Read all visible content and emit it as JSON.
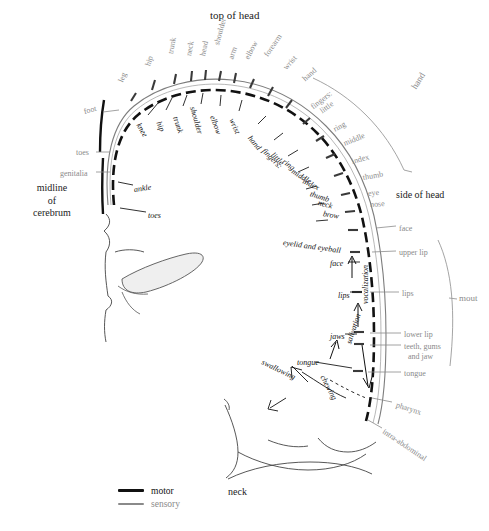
{
  "figure": {
    "type": "anatomical-diagram",
    "name": "penfield-motor-sensory-homunculus",
    "title_top": "top of head",
    "label_side_of_head": "side of head",
    "label_midline": "midline\nof\ncerebrum",
    "label_midline_line1": "midline",
    "label_midline_line2": "of",
    "label_midline_line3": "cerebrum",
    "label_neck_bottom": "neck",
    "bracket_hand": "hand",
    "bracket_mouth": "mout",
    "colors": {
      "motor": "#141414",
      "sensory": "#8a8a8a",
      "background": "#ffffff",
      "outline": "#333333"
    }
  },
  "legend": {
    "items": [
      {
        "label": "motor",
        "style": "thick-black-line",
        "color": "#141414"
      },
      {
        "label": "sensory",
        "style": "thin-gray-line",
        "color": "#8a8a8a"
      }
    ]
  },
  "sensory_strip": {
    "description": "Outer gray labels — postcentral (sensory) homunculus",
    "labels": [
      {
        "text": "leg",
        "rot": -68,
        "x": 121,
        "y": 78
      },
      {
        "text": "hip",
        "rot": -72,
        "x": 148,
        "y": 62
      },
      {
        "text": "trunk",
        "rot": -80,
        "x": 171,
        "y": 50
      },
      {
        "text": "neck",
        "rot": -80,
        "x": 189,
        "y": 52
      },
      {
        "text": "head",
        "rot": -78,
        "x": 203,
        "y": 52
      },
      {
        "text": "shoulder",
        "rot": -75,
        "x": 217,
        "y": 41
      },
      {
        "text": "arm",
        "rot": -70,
        "x": 231,
        "y": 55
      },
      {
        "text": "elbow",
        "rot": -62,
        "x": 247,
        "y": 55
      },
      {
        "text": "forearm",
        "rot": -55,
        "x": 266,
        "y": 52
      },
      {
        "text": "wrist",
        "rot": -48,
        "x": 285,
        "y": 65
      },
      {
        "text": "hand",
        "rot": -42,
        "x": 304,
        "y": 76
      },
      {
        "text": "fingers:",
        "rot": -38,
        "x": 312,
        "y": 104
      },
      {
        "text": "little",
        "rot": -36,
        "x": 321,
        "y": 108
      },
      {
        "text": "ring",
        "rot": -28,
        "x": 334,
        "y": 126
      },
      {
        "text": "middle",
        "rot": -22,
        "x": 344,
        "y": 140
      },
      {
        "text": "index",
        "rot": -16,
        "x": 352,
        "y": 158
      },
      {
        "text": "thumb",
        "rot": -10,
        "x": 363,
        "y": 174
      },
      {
        "text": "eye",
        "rot": -6,
        "x": 368,
        "y": 190
      },
      {
        "text": "nose",
        "rot": -4,
        "x": 370,
        "y": 201
      },
      {
        "text": "face",
        "rot": 0,
        "x": 399,
        "y": 225
      },
      {
        "text": "upper lip",
        "rot": 0,
        "x": 399,
        "y": 249
      },
      {
        "text": "lips",
        "rot": 0,
        "x": 402,
        "y": 290
      },
      {
        "text": "lower lip",
        "rot": 0,
        "x": 404,
        "y": 331
      },
      {
        "text": "teeth, gums",
        "rot": 0,
        "x": 404,
        "y": 343
      },
      {
        "text": "and jaw",
        "rot": 0,
        "x": 408,
        "y": 353
      },
      {
        "text": "tongue",
        "rot": 0,
        "x": 404,
        "y": 370
      },
      {
        "text": "pharynx",
        "rot": 18,
        "x": 396,
        "y": 401
      },
      {
        "text": "intra-abdominal",
        "rot": 34,
        "x": 383,
        "y": 427
      },
      {
        "text": "foot",
        "rot": -14,
        "x": 84,
        "y": 108
      },
      {
        "text": "toes",
        "rot": 0,
        "x": 76,
        "y": 149
      },
      {
        "text": "genitalia",
        "rot": 0,
        "x": 60,
        "y": 170
      }
    ]
  },
  "motor_strip": {
    "description": "Inner black italic labels — precentral (motor) homunculus",
    "labels": [
      {
        "text": "knee",
        "rot": 60,
        "x": 138,
        "y": 120
      },
      {
        "text": "hip",
        "rot": 66,
        "x": 158,
        "y": 118
      },
      {
        "text": "trunk",
        "rot": 72,
        "x": 175,
        "y": 113
      },
      {
        "text": "shoulder",
        "rot": 74,
        "x": 192,
        "y": 103
      },
      {
        "text": "elbow",
        "rot": 70,
        "x": 212,
        "y": 112
      },
      {
        "text": "wrist",
        "rot": 66,
        "x": 231,
        "y": 115
      },
      {
        "text": "hand",
        "rot": 50,
        "x": 249,
        "y": 133
      },
      {
        "text": "fingers:",
        "rot": 45,
        "x": 263,
        "y": 146
      },
      {
        "text": "little",
        "rot": 44,
        "x": 272,
        "y": 150
      },
      {
        "text": "ring",
        "rot": 38,
        "x": 283,
        "y": 157
      },
      {
        "text": "middle",
        "rot": 32,
        "x": 292,
        "y": 167
      },
      {
        "text": "index",
        "rot": 26,
        "x": 303,
        "y": 177
      },
      {
        "text": "thumb",
        "rot": 18,
        "x": 310,
        "y": 190
      },
      {
        "text": "neck",
        "rot": 14,
        "x": 318,
        "y": 199
      },
      {
        "text": "brow",
        "rot": 10,
        "x": 323,
        "y": 210
      },
      {
        "text": "eyelid and eyeball",
        "rot": 8,
        "x": 283,
        "y": 239
      },
      {
        "text": "face",
        "rot": 0,
        "x": 330,
        "y": 260
      },
      {
        "text": "lips",
        "rot": 0,
        "x": 338,
        "y": 292
      },
      {
        "text": "vocalization",
        "rot": -90,
        "x": 366,
        "y": 300
      },
      {
        "text": "jaws",
        "rot": 0,
        "x": 330,
        "y": 333
      },
      {
        "text": "salivation",
        "rot": -72,
        "x": 349,
        "y": 340
      },
      {
        "text": "tongue",
        "rot": 0,
        "x": 297,
        "y": 359
      },
      {
        "text": "swallowing",
        "rot": 26,
        "x": 262,
        "y": 358
      },
      {
        "text": "chewing",
        "rot": 62,
        "x": 322,
        "y": 372
      },
      {
        "text": "ankle",
        "rot": -8,
        "x": 134,
        "y": 186
      },
      {
        "text": "toes",
        "rot": 0,
        "x": 148,
        "y": 212
      }
    ]
  }
}
